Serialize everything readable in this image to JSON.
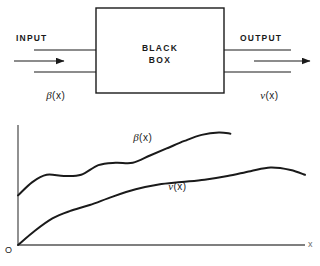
{
  "figure": {
    "kind": "block-diagram-with-plot",
    "stroke_color": "#1a1a1a",
    "background": "#ffffff"
  },
  "block_diagram": {
    "box_label_line1": "BLACK",
    "box_label_line2": "BOX",
    "input_label": "INPUT",
    "output_label": "OUTPUT",
    "input_signal": "β(x)",
    "output_signal": "v(x)",
    "input_arrow": "arrow-right-icon",
    "output_arrow": "arrow-right-icon"
  },
  "plot": {
    "origin_label": "O",
    "x_axis_label": "x",
    "curve1_label": "β(x)",
    "curve2_label": "v(x)"
  },
  "chart_data": {
    "type": "line",
    "title": "",
    "xlabel": "x",
    "ylabel": "",
    "grid": false,
    "legend": "inline-labels",
    "xlim": [
      0,
      1
    ],
    "ylim": [
      0,
      1
    ],
    "series": [
      {
        "name": "β(x)",
        "label": "β(x)",
        "x": [
          0.0,
          0.05,
          0.1,
          0.16,
          0.22,
          0.28,
          0.34,
          0.4,
          0.46,
          0.52,
          0.58,
          0.64,
          0.7,
          0.74
        ],
        "y": [
          0.41,
          0.52,
          0.58,
          0.57,
          0.58,
          0.66,
          0.68,
          0.68,
          0.74,
          0.8,
          0.86,
          0.91,
          0.93,
          0.92
        ]
      },
      {
        "name": "v(x)",
        "label": "v(x)",
        "x": [
          0.0,
          0.06,
          0.12,
          0.18,
          0.25,
          0.33,
          0.41,
          0.49,
          0.57,
          0.65,
          0.73,
          0.81,
          0.88,
          0.95,
          1.0
        ],
        "y": [
          0.0,
          0.12,
          0.22,
          0.28,
          0.33,
          0.4,
          0.46,
          0.5,
          0.52,
          0.54,
          0.57,
          0.61,
          0.64,
          0.62,
          0.58
        ]
      }
    ]
  }
}
